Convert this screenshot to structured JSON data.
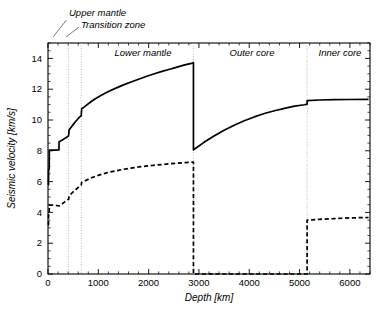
{
  "chart_data": {
    "type": "line",
    "title": "",
    "xlabel": "Depth [km]",
    "ylabel": "Seismic velocity [km/s]",
    "xlim": [
      0,
      6400
    ],
    "ylim": [
      0,
      15
    ],
    "xticks": [
      0,
      1000,
      2000,
      3000,
      4000,
      5000,
      6000
    ],
    "xticklabels": [
      "0",
      "1000",
      "2000",
      "3000",
      "4000",
      "5000",
      "6000"
    ],
    "yticks": [
      0,
      2,
      4,
      6,
      8,
      10,
      12,
      14
    ],
    "yticklabels": [
      "0",
      "2",
      "4",
      "6",
      "8",
      "10",
      "12",
      "14"
    ],
    "grid": false,
    "legend_position": "none",
    "series": [
      {
        "name": "P-wave velocity",
        "style": "solid",
        "color": "#000000",
        "points": [
          [
            0,
            5.8
          ],
          [
            10,
            5.8
          ],
          [
            12,
            6.8
          ],
          [
            24,
            6.8
          ],
          [
            26,
            8.04
          ],
          [
            80,
            8.04
          ],
          [
            120,
            8.05
          ],
          [
            180,
            8.05
          ],
          [
            200,
            8.06
          ],
          [
            218,
            8.06
          ],
          [
            220,
            8.58
          ],
          [
            260,
            8.65
          ],
          [
            300,
            8.73
          ],
          [
            340,
            8.82
          ],
          [
            380,
            8.9
          ],
          [
            400,
            8.95
          ],
          [
            410,
            9.0
          ],
          [
            420,
            9.36
          ],
          [
            460,
            9.53
          ],
          [
            500,
            9.7
          ],
          [
            540,
            9.87
          ],
          [
            580,
            10.02
          ],
          [
            620,
            10.17
          ],
          [
            660,
            10.27
          ],
          [
            670,
            10.75
          ],
          [
            700,
            10.79
          ],
          [
            760,
            10.95
          ],
          [
            840,
            11.15
          ],
          [
            940,
            11.38
          ],
          [
            1060,
            11.6
          ],
          [
            1200,
            11.85
          ],
          [
            1350,
            12.07
          ],
          [
            1500,
            12.28
          ],
          [
            1650,
            12.47
          ],
          [
            1800,
            12.65
          ],
          [
            1950,
            12.82
          ],
          [
            2100,
            12.99
          ],
          [
            2250,
            13.14
          ],
          [
            2400,
            13.28
          ],
          [
            2550,
            13.42
          ],
          [
            2700,
            13.56
          ],
          [
            2850,
            13.68
          ],
          [
            2891,
            13.72
          ],
          [
            2891,
            8.06
          ],
          [
            2950,
            8.2
          ],
          [
            3100,
            8.55
          ],
          [
            3300,
            8.96
          ],
          [
            3500,
            9.33
          ],
          [
            3700,
            9.66
          ],
          [
            3900,
            9.95
          ],
          [
            4100,
            10.2
          ],
          [
            4300,
            10.42
          ],
          [
            4500,
            10.6
          ],
          [
            4700,
            10.76
          ],
          [
            4900,
            10.9
          ],
          [
            5100,
            10.99
          ],
          [
            5150,
            11.03
          ],
          [
            5150,
            11.26
          ],
          [
            5400,
            11.3
          ],
          [
            5700,
            11.32
          ],
          [
            6000,
            11.33
          ],
          [
            6371,
            11.34
          ]
        ]
      },
      {
        "name": "S-wave velocity",
        "style": "dashed",
        "color": "#000000",
        "points": [
          [
            0,
            3.2
          ],
          [
            10,
            3.2
          ],
          [
            12,
            3.9
          ],
          [
            24,
            3.9
          ],
          [
            26,
            4.47
          ],
          [
            80,
            4.48
          ],
          [
            140,
            4.46
          ],
          [
            200,
            4.43
          ],
          [
            220,
            4.42
          ],
          [
            260,
            4.5
          ],
          [
            300,
            4.6
          ],
          [
            340,
            4.7
          ],
          [
            380,
            4.78
          ],
          [
            410,
            4.87
          ],
          [
            420,
            5.07
          ],
          [
            460,
            5.2
          ],
          [
            500,
            5.33
          ],
          [
            540,
            5.45
          ],
          [
            580,
            5.56
          ],
          [
            620,
            5.68
          ],
          [
            660,
            5.77
          ],
          [
            670,
            5.96
          ],
          [
            700,
            6.0
          ],
          [
            760,
            6.09
          ],
          [
            840,
            6.21
          ],
          [
            940,
            6.34
          ],
          [
            1060,
            6.47
          ],
          [
            1200,
            6.6
          ],
          [
            1350,
            6.7
          ],
          [
            1500,
            6.8
          ],
          [
            1650,
            6.88
          ],
          [
            1800,
            6.95
          ],
          [
            1950,
            7.0
          ],
          [
            2100,
            7.06
          ],
          [
            2250,
            7.1
          ],
          [
            2400,
            7.15
          ],
          [
            2550,
            7.19
          ],
          [
            2700,
            7.23
          ],
          [
            2850,
            7.26
          ],
          [
            2891,
            7.27
          ],
          [
            2891,
            0
          ],
          [
            5150,
            0
          ],
          [
            5150,
            3.5
          ],
          [
            5400,
            3.55
          ],
          [
            5700,
            3.6
          ],
          [
            6000,
            3.64
          ],
          [
            6371,
            3.67
          ]
        ]
      }
    ],
    "boundaries": [
      {
        "name": "upper-mantle-boundary",
        "depth": 410
      },
      {
        "name": "transition-zone-boundary",
        "depth": 660
      },
      {
        "name": "core-mantle-boundary",
        "depth": 2891
      },
      {
        "name": "inner-core-boundary",
        "depth": 5150
      }
    ],
    "annotations": [
      {
        "name": "upper-mantle",
        "text": "Upper mantle",
        "placement": "outside-top"
      },
      {
        "name": "transition-zone",
        "text": "Transition zone",
        "placement": "outside-top"
      },
      {
        "name": "lower-mantle",
        "text": "Lower mantle",
        "placement": "inside-top"
      },
      {
        "name": "outer-core",
        "text": "Outer core",
        "placement": "inside-top"
      },
      {
        "name": "inner-core",
        "text": "Inner core",
        "placement": "inside-top"
      }
    ]
  },
  "labels": {
    "x_axis_title": "Depth [km]",
    "y_axis_title": "Seismic velocity [km/s]",
    "upper_mantle": "Upper mantle",
    "transition_zone": "Transition zone",
    "lower_mantle": "Lower mantle",
    "outer_core": "Outer core",
    "inner_core": "Inner core",
    "x_tick_0": "0",
    "x_tick_1000": "1000",
    "x_tick_2000": "2000",
    "x_tick_3000": "3000",
    "x_tick_4000": "4000",
    "x_tick_5000": "5000",
    "x_tick_6000": "6000",
    "y_tick_0": "0",
    "y_tick_2": "2",
    "y_tick_4": "4",
    "y_tick_6": "6",
    "y_tick_8": "8",
    "y_tick_10": "10",
    "y_tick_12": "12",
    "y_tick_14": "14"
  },
  "colors": {
    "curve": "#000000",
    "boundary_line": "#a8a8a8",
    "background": "#ffffff"
  }
}
